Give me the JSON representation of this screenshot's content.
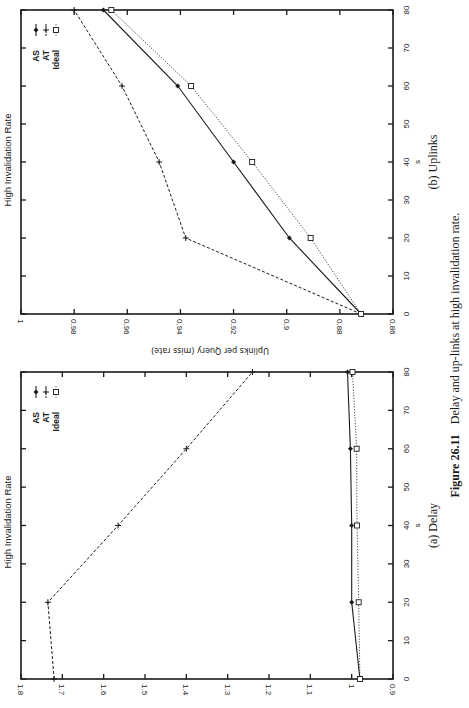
{
  "figure": {
    "number_label": "Figure 26.11",
    "caption_text": "Delay and up-links at high invalidation rate."
  },
  "chart_data": [
    {
      "type": "line",
      "id": "delay",
      "subcaption": "(a) Delay",
      "title": "High Invalidation Rate",
      "xlabel": "s",
      "ylabel": "",
      "x": [
        0,
        20,
        40,
        60,
        80
      ],
      "xlim": [
        0,
        80
      ],
      "xticks": [
        "0",
        "10",
        "20",
        "30",
        "40",
        "50",
        "60",
        "70",
        "80"
      ],
      "ylim": [
        0.9,
        1.8
      ],
      "yticks": [
        "0.9",
        "1",
        "1.1",
        "1.2",
        "1.3",
        "1.4",
        "1.5",
        "1.6",
        "1.7",
        "1.8"
      ],
      "grid": false,
      "legend_position": "upper right",
      "series": [
        {
          "name": "AS",
          "marker": "diamond",
          "style": "solid",
          "values": [
            0.98,
            1.0,
            1.0,
            1.003,
            1.01
          ]
        },
        {
          "name": "AT",
          "marker": "plus",
          "style": "dashed",
          "values": [
            1.72,
            1.735,
            1.565,
            1.4,
            1.24
          ]
        },
        {
          "name": "Ideal",
          "marker": "square",
          "style": "dotted",
          "values": [
            0.98,
            0.983,
            0.987,
            0.988,
            0.998
          ]
        }
      ]
    },
    {
      "type": "line",
      "id": "uplinks",
      "subcaption": "(b) Uplinks",
      "title": "High Invalidation Rate",
      "xlabel": "s",
      "ylabel": "Uplinks per Query (miss rate)",
      "x": [
        0,
        20,
        40,
        60,
        80
      ],
      "xlim": [
        0,
        80
      ],
      "xticks": [
        "0",
        "10",
        "20",
        "30",
        "40",
        "50",
        "60",
        "70",
        "80"
      ],
      "ylim": [
        0.86,
        1.0
      ],
      "yticks": [
        "0.86",
        "0.88",
        "0.9",
        "0.92",
        "0.94",
        "0.96",
        "0.98",
        "1"
      ],
      "grid": false,
      "legend_position": "upper right",
      "series": [
        {
          "name": "AS",
          "marker": "diamond",
          "style": "solid",
          "values": [
            0.872,
            0.899,
            0.92,
            0.941,
            0.969
          ]
        },
        {
          "name": "AT",
          "marker": "plus",
          "style": "dashed",
          "values": [
            0.872,
            0.938,
            0.948,
            0.962,
            0.98
          ]
        },
        {
          "name": "Ideal",
          "marker": "square",
          "style": "dotted",
          "values": [
            0.872,
            0.891,
            0.913,
            0.936,
            0.966
          ]
        }
      ]
    }
  ]
}
